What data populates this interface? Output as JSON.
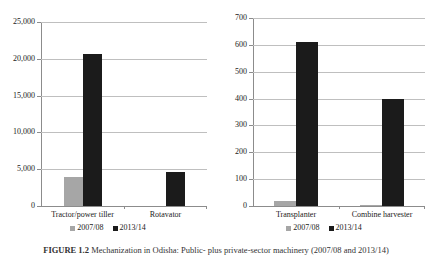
{
  "figure": {
    "caption_prefix": "FIGURE 1.2",
    "caption_text": "Mechanization in Odisha: Public- plus private-sector machinery (2007/08 and 2013/14)"
  },
  "legend": {
    "series": [
      {
        "label": "2007/08",
        "color": "#a6a6a6"
      },
      {
        "label": "2013/14",
        "color": "#1b1b1b"
      }
    ]
  },
  "chart_data": [
    {
      "type": "bar",
      "panel": "left",
      "title": "",
      "xlabel": "",
      "ylabel": "",
      "categories": [
        "Tractor/power tiller",
        "Rotavator"
      ],
      "series": [
        {
          "name": "2007/08",
          "values": [
            3900,
            0
          ]
        },
        {
          "name": "2013/14",
          "values": [
            20700,
            4600
          ]
        }
      ],
      "ylim": [
        0,
        25000
      ],
      "yticks": [
        0,
        5000,
        10000,
        15000,
        20000,
        25000
      ],
      "ytick_labels": [
        "0",
        "5,000",
        "10,000",
        "15,000",
        "20,000",
        "25,000"
      ],
      "grid": true,
      "legend_position": "bottom"
    },
    {
      "type": "bar",
      "panel": "right",
      "title": "",
      "xlabel": "",
      "ylabel": "",
      "categories": [
        "Transplanter",
        "Combine harvester"
      ],
      "series": [
        {
          "name": "2007/08",
          "values": [
            17,
            3
          ]
        },
        {
          "name": "2013/14",
          "values": [
            610,
            400
          ]
        }
      ],
      "ylim": [
        0,
        700
      ],
      "yticks": [
        0,
        100,
        200,
        300,
        400,
        500,
        600,
        700
      ],
      "ytick_labels": [
        "0",
        "100",
        "200",
        "300",
        "400",
        "500",
        "600",
        "700"
      ],
      "grid": true,
      "legend_position": "bottom"
    }
  ]
}
